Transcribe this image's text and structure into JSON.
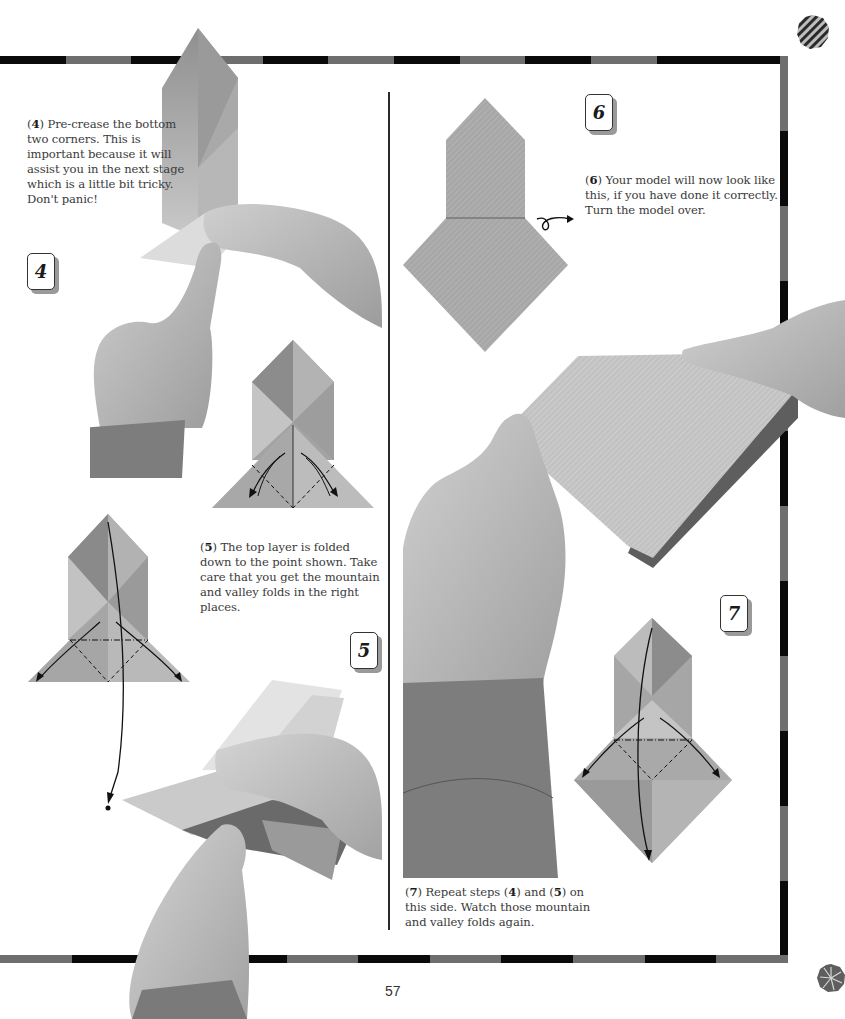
{
  "page": {
    "number": "57",
    "frame": {
      "colors": {
        "dark": "#0a0a0a",
        "gray": "#6e6e6e"
      }
    }
  },
  "steps": [
    {
      "id": "4",
      "badge": "4",
      "caption_num": "4",
      "caption": " Pre-crease the bottom two corners. This is important because it will assist you in the next stage which is a little bit tricky. Don't panic!"
    },
    {
      "id": "5",
      "badge": "5",
      "caption_num": "5",
      "caption": " The top layer is folded down to the point shown. Take care that you get the mountain and valley folds in the right places."
    },
    {
      "id": "6",
      "badge": "6",
      "caption_num": "6",
      "caption": " Your model will now look like this, if you have done it correctly. Turn the model over."
    },
    {
      "id": "7",
      "badge": "7",
      "caption_num": "7",
      "caption_parts": [
        " Repeat steps ",
        "4",
        " and ",
        "5",
        " on this side. Watch those mountain and valley folds again."
      ]
    }
  ],
  "icons": {
    "turn_over": "turn-over-arrow-icon",
    "top_emblem": "origami-kusudama-emblem",
    "bottom_emblem": "origami-rosette-emblem"
  },
  "photos": [
    {
      "id": "step4-photo",
      "description": "hands pre-creasing bottom corners of folded paper"
    },
    {
      "id": "step4-diagram",
      "description": "folded model with dashed crease lines and arrows at bottom corners"
    },
    {
      "id": "step5-diagram",
      "description": "model with mountain and valley fold lines and long curved arrow"
    },
    {
      "id": "step5-photo",
      "description": "hands folding top layer down"
    },
    {
      "id": "step6-diagram",
      "description": "finished model - pentagon top on square base"
    },
    {
      "id": "step7-photo",
      "description": "hands holding model folded in half"
    },
    {
      "id": "step7-diagram",
      "description": "model with mountain/valley fold lines and curved arrows"
    }
  ]
}
